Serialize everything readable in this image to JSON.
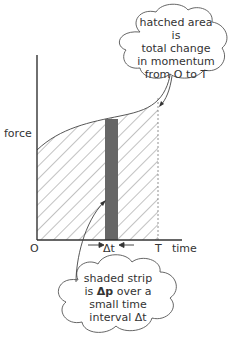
{
  "axes": {
    "y_label": "force",
    "x_label": "time",
    "origin_label": "O",
    "end_label": "T",
    "strip_label": "Δt"
  },
  "callouts": {
    "top": {
      "lines": [
        "hatched area is",
        "total change",
        "in momentum",
        "from O to T"
      ]
    },
    "bottom": {
      "line1": "shaded strip",
      "line2_prefix": "is ",
      "line2_bold": "Δp",
      "line2_suffix": " over a",
      "line3": "small time",
      "line4": "interval Δt"
    }
  },
  "colors": {
    "axis": "#333333",
    "hatch": "#555555",
    "strip": "#666666"
  }
}
